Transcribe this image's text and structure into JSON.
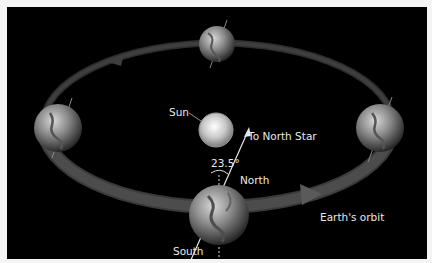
{
  "diagram": {
    "labels": {
      "sun": "Sun",
      "north_star": "To North Star",
      "tilt_angle": "23.5°",
      "north": "North",
      "south": "South",
      "orbit": "Earth's orbit"
    },
    "colors": {
      "background": "#000000",
      "page": "#f4f4f4",
      "orbit_band": "#5a5a5a",
      "text": "#e8e8e8"
    },
    "earth_positions": [
      "top",
      "left",
      "right",
      "bottom-front"
    ]
  }
}
